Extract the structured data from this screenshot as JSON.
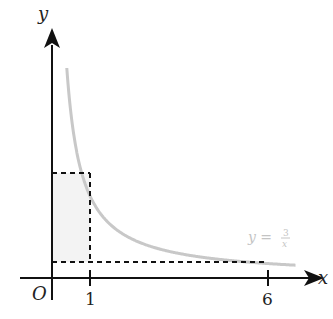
{
  "chart_data": {
    "type": "line",
    "title": "",
    "function": "y = 3/x",
    "curve_label": {
      "lhs": "y =",
      "num": "3",
      "den": "x"
    },
    "xlabel": "x",
    "ylabel": "y",
    "origin_label": "O",
    "x_ticks": [
      {
        "value": 1,
        "label": "1"
      },
      {
        "value": 6,
        "label": "6"
      }
    ],
    "series": [
      {
        "name": "y = 3/x",
        "x": [
          0.45,
          0.6,
          0.8,
          1,
          1.5,
          2,
          3,
          4,
          5,
          6,
          7
        ],
        "values": [
          6.67,
          5,
          3.75,
          3,
          2,
          1.5,
          1,
          0.75,
          0.6,
          0.5,
          0.43
        ]
      }
    ],
    "shaded_rectangle": {
      "x": [
        0,
        1
      ],
      "y": [
        0.5,
        3
      ]
    },
    "dashed_lines": [
      {
        "from": [
          0,
          3
        ],
        "to": [
          1,
          3
        ]
      },
      {
        "from": [
          1,
          3
        ],
        "to": [
          1,
          0.5
        ]
      },
      {
        "from": [
          0,
          0.5
        ],
        "to": [
          6,
          0.5
        ]
      }
    ],
    "colors": {
      "axis": "#111111",
      "curve": "#c8c8c8",
      "shade": "#f3f3f3",
      "dash": "#111111"
    },
    "grid": false
  }
}
